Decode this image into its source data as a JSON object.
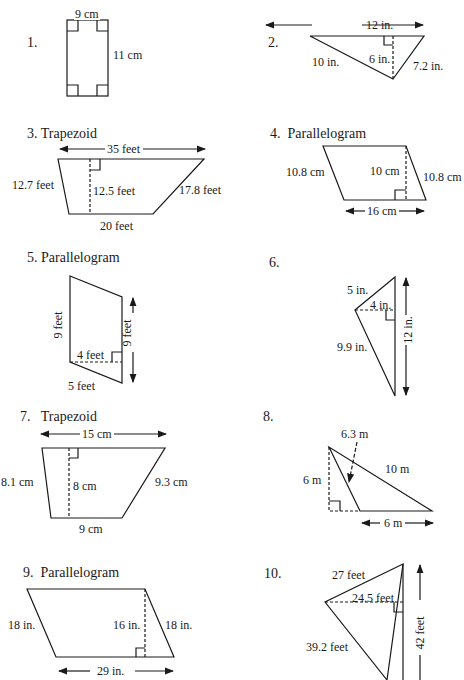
{
  "problems": [
    {
      "number": "1.",
      "shape": "rectangle",
      "labels": {
        "top": "9 cm",
        "right": "11 cm"
      }
    },
    {
      "number": "2.",
      "shape": "triangle",
      "labels": {
        "base": "12 in.",
        "left": "10 in.",
        "height": "6 in.",
        "right": "7.2 in."
      }
    },
    {
      "number": "3.",
      "title": "Trapezoid",
      "shape": "trapezoid",
      "labels": {
        "top": "35 feet",
        "left": "12.7 feet",
        "height": "12.5 feet",
        "right": "17.8 feet",
        "bottom": "20 feet"
      }
    },
    {
      "number": "4.",
      "title": "Parallelogram",
      "shape": "parallelogram",
      "labels": {
        "left": "10.8 cm",
        "height": "10 cm",
        "right": "10.8 cm",
        "bottom": "16 cm"
      }
    },
    {
      "number": "5.",
      "title": "Parallelogram",
      "shape": "parallelogram",
      "labels": {
        "left": "9 feet",
        "right": "9 feet",
        "height": "4 feet",
        "bottom": "5 feet"
      }
    },
    {
      "number": "6.",
      "shape": "triangle",
      "labels": {
        "top": "5 in.",
        "height": "4 in.",
        "bottom": "9.9 in.",
        "base": "12 in."
      }
    },
    {
      "number": "7.",
      "title": "Trapezoid",
      "shape": "trapezoid",
      "labels": {
        "top": "15 cm",
        "left": "8.1 cm",
        "height": "8 cm",
        "right": "9.3 cm",
        "bottom": "9 cm"
      }
    },
    {
      "number": "8.",
      "shape": "triangle",
      "labels": {
        "side": "6.3 m",
        "hyp": "10 m",
        "height": "6 m",
        "base": "6 m"
      }
    },
    {
      "number": "9.",
      "title": "Parallelogram",
      "shape": "parallelogram",
      "labels": {
        "left": "18 in.",
        "height": "16 in.",
        "right": "18 in.",
        "bottom": "29 in."
      }
    },
    {
      "number": "10.",
      "shape": "triangle",
      "labels": {
        "top": "27 feet",
        "height": "24.5 feet",
        "bottom": "39.2 feet",
        "base": "42 feet"
      }
    }
  ]
}
